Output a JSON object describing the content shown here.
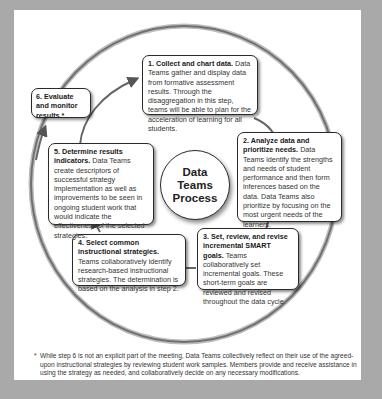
{
  "diagram": {
    "center_label": [
      "Data",
      "Teams",
      "Process"
    ],
    "steps": [
      {
        "number": "1.",
        "title": "Collect and chart data.",
        "body": "Data Teams gather and display data from formative assessment results. Through the disaggregation in this step, teams will be able to plan for the acceleration of learning for all students."
      },
      {
        "number": "2.",
        "title": "Analyze data and prioritize needs.",
        "body": "Data Teams identify the strengths and needs of student performance and then form inferences based on the data. Data Teams also prioritize by focusing on the most urgent needs of the learners."
      },
      {
        "number": "3.",
        "title": "Set, review, and revise incremental SMART goals.",
        "body": "Teams collaboratively set incremental goals. These short-term goals are reviewed and revised throughout the data cycle."
      },
      {
        "number": "4.",
        "title": "Select common instructional strategies.",
        "body": "Teams collaboratively identify research-based instructional strategies. The determination is based on the analysis in step 2."
      },
      {
        "number": "5.",
        "title": "Determine results indicators.",
        "body": "Data Teams create descriptors of successful strategy implementation as well as improvements to be seen in ongoing student work that would indicate the effectiveness of the selected strategies."
      },
      {
        "number": "6.",
        "title": "Evaluate and monitor results.*",
        "body": ""
      }
    ],
    "footnote": "While step 6 is not an explicit part of the meeting, Data Teams collectively reflect on their use of the agreed-upon instructional strategies by reviewing student work samples. Members provide and receive assistance in using the strategy as needed, and collaboratively decide on any necessary modifications.",
    "footnote_marker": "*"
  },
  "colors": {
    "frame": "#a9a9a9",
    "panel": "#ffffff",
    "ring": "#6e6e6e",
    "box_border": "#2a2a2a"
  }
}
